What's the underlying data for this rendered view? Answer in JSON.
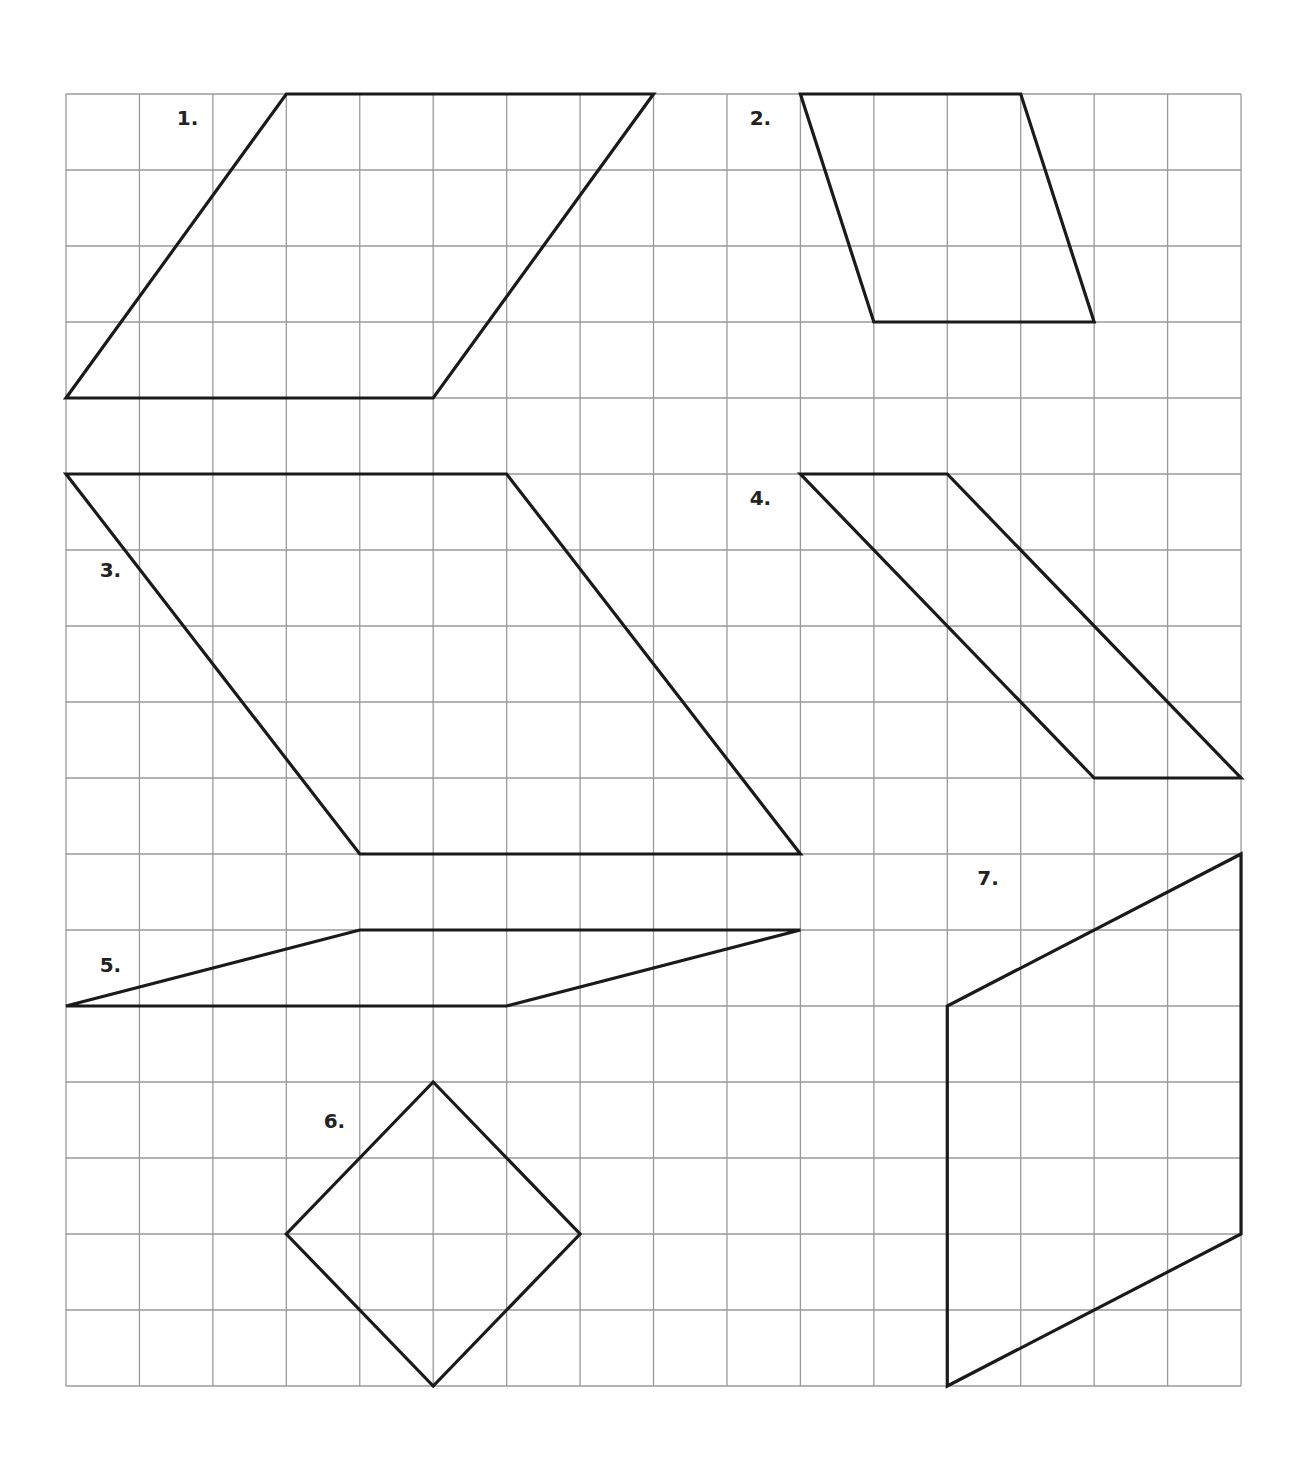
{
  "worksheet": {
    "grid": {
      "origin_x": 66,
      "origin_y": 94,
      "cell_w": 73.44,
      "cell_h": 76.0,
      "cols": 16,
      "rows": 17,
      "line_color": "#9a9a9a",
      "shape_color": "#1a1a1a"
    },
    "shapes": [
      {
        "label": "1.",
        "label_pos": [
          1.4,
          0.1
        ],
        "points": [
          [
            3,
            0
          ],
          [
            8,
            0
          ],
          [
            5,
            4
          ],
          [
            0,
            4
          ]
        ]
      },
      {
        "label": "2.",
        "label_pos": [
          9.2,
          0.1
        ],
        "points": [
          [
            10,
            0
          ],
          [
            13,
            0
          ],
          [
            14,
            3
          ],
          [
            11,
            3
          ]
        ]
      },
      {
        "label": "3.",
        "label_pos": [
          0.35,
          1.05
        ],
        "label_row_offset": 5,
        "points": [
          [
            0,
            5
          ],
          [
            6,
            5
          ],
          [
            10,
            10
          ],
          [
            4,
            10
          ]
        ]
      },
      {
        "label": "4.",
        "label_pos": [
          9.2,
          0.1
        ],
        "label_row_offset": 5,
        "points": [
          [
            10,
            5
          ],
          [
            12,
            5
          ],
          [
            16,
            9
          ],
          [
            14,
            9
          ]
        ]
      },
      {
        "label": "5.",
        "label_pos": [
          0.35,
          0.25
        ],
        "label_row_offset": 11,
        "points": [
          [
            4,
            11
          ],
          [
            10,
            11
          ],
          [
            6,
            12
          ],
          [
            0,
            12
          ]
        ]
      },
      {
        "label": "6.",
        "label_pos": [
          3.4,
          0.3
        ],
        "label_row_offset": 13,
        "points": [
          [
            5,
            13
          ],
          [
            7,
            15
          ],
          [
            5,
            17
          ],
          [
            3,
            15
          ]
        ]
      },
      {
        "label": "7.",
        "label_pos": [
          12.3,
          0.1
        ],
        "label_row_offset": 10,
        "points": [
          [
            16,
            10
          ],
          [
            16,
            15
          ],
          [
            12,
            17
          ],
          [
            12,
            12
          ]
        ]
      }
    ]
  }
}
